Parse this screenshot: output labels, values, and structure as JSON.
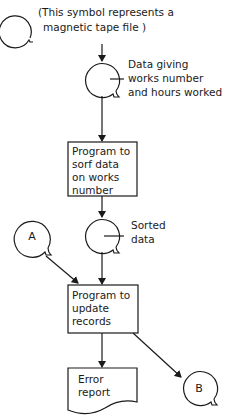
{
  "legend": {
    "line1": "(This symbol represents a",
    "line2": "magnetic tape file )"
  },
  "tape_input": {
    "label": [
      "Data giving",
      "works number",
      "and hours worked"
    ]
  },
  "process_sort": {
    "label": [
      "Program to",
      "sorf data",
      "on works",
      "number"
    ]
  },
  "tape_sorted": {
    "label": [
      "Sorted",
      "data"
    ]
  },
  "connector_a": {
    "label": "A"
  },
  "process_update": {
    "label": [
      "Program to",
      "update",
      "records"
    ]
  },
  "error_report": {
    "label": [
      "Error",
      "report"
    ]
  },
  "connector_b": {
    "label": "B"
  },
  "colors": {
    "ink": "#1a1a1a",
    "background": "#ffffff"
  }
}
